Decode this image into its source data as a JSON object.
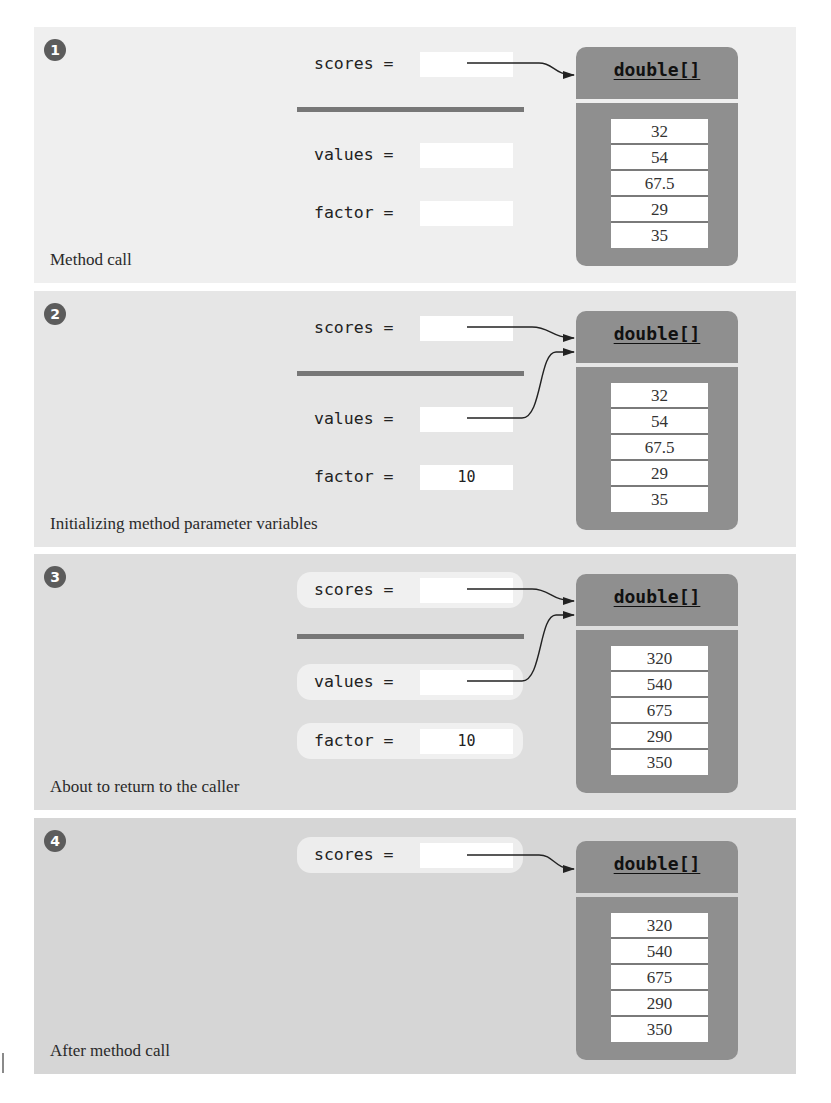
{
  "colors": {
    "panel_backgrounds": [
      "#efefef",
      "#e6e6e6",
      "#dedede",
      "#d6d6d6"
    ],
    "array_object": "#8f8f8f",
    "badge": "#5c5c5c",
    "divider": "#777777"
  },
  "panels": [
    {
      "step": "1",
      "step_icon": "circled-number-1-icon",
      "caption": "Method call",
      "variables": {
        "scores": {
          "label": "scores =",
          "value": ""
        },
        "values": {
          "label": "values =",
          "value": ""
        },
        "factor": {
          "label": "factor =",
          "value": ""
        }
      },
      "array": {
        "type": "double[]",
        "elements": [
          "32",
          "54",
          "67.5",
          "29",
          "35"
        ]
      }
    },
    {
      "step": "2",
      "step_icon": "circled-number-2-icon",
      "caption": "Initializing method parameter variables",
      "variables": {
        "scores": {
          "label": "scores =",
          "value": ""
        },
        "values": {
          "label": "values =",
          "value": ""
        },
        "factor": {
          "label": "factor =",
          "value": "10"
        }
      },
      "array": {
        "type": "double[]",
        "elements": [
          "32",
          "54",
          "67.5",
          "29",
          "35"
        ]
      }
    },
    {
      "step": "3",
      "step_icon": "circled-number-3-icon",
      "caption": "About to return to the caller",
      "variables": {
        "scores": {
          "label": "scores =",
          "value": ""
        },
        "values": {
          "label": "values =",
          "value": ""
        },
        "factor": {
          "label": "factor =",
          "value": "10"
        }
      },
      "array": {
        "type": "double[]",
        "elements": [
          "320",
          "540",
          "675",
          "290",
          "350"
        ]
      }
    },
    {
      "step": "4",
      "step_icon": "circled-number-4-icon",
      "caption": "After method call",
      "variables": {
        "scores": {
          "label": "scores =",
          "value": ""
        }
      },
      "array": {
        "type": "double[]",
        "elements": [
          "320",
          "540",
          "675",
          "290",
          "350"
        ]
      }
    }
  ]
}
